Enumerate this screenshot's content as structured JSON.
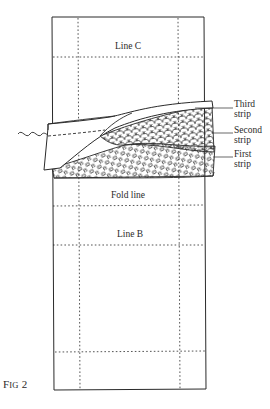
{
  "figure": {
    "caption_prefix": "F",
    "caption_smallcaps": "ig",
    "caption_number": " 2"
  },
  "labels": {
    "line_c": "Line C",
    "fold_line": "Fold line",
    "line_b": "Line B",
    "strips": [
      {
        "line1": "Third",
        "line2": "strip"
      },
      {
        "line1": "Second",
        "line2": "strip"
      },
      {
        "line1": "First",
        "line2": "strip"
      }
    ]
  },
  "colors": {
    "ink": "#2a2a2a",
    "background": "#ffffff"
  },
  "patterns": {
    "second_strip": "scallop",
    "first_strip": "rectangles"
  }
}
